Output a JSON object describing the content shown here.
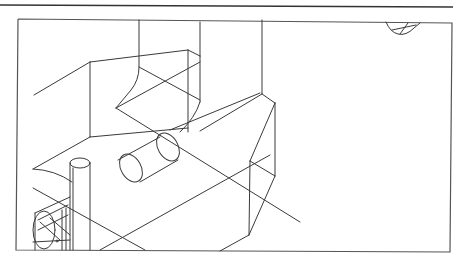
{
  "drawing": {
    "type": "3d-wireframe-cad-view",
    "line_color": "#3a3a3a",
    "frame_color": "#555555",
    "background": "#ffffff",
    "objects": [
      "box-body",
      "curved-duct",
      "horizontal-cylinder",
      "vertical-pipe",
      "corner-fitting",
      "cut-cylinder-top-right"
    ]
  }
}
